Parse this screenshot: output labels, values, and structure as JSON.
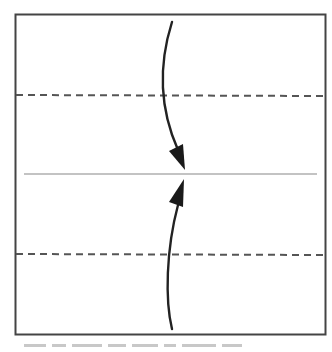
{
  "diagram": {
    "type": "fold-instruction",
    "colors": {
      "background": "#ffffff",
      "border": "#444444",
      "dashed_line": "#555555",
      "center_line": "#888888",
      "arrow": "#222222"
    },
    "square": {
      "x": 15,
      "y": 14,
      "width": 310,
      "height": 320
    },
    "fold_lines": [
      {
        "name": "upper-fold-line",
        "style": "dashed",
        "y": 95
      },
      {
        "name": "lower-fold-line",
        "style": "dashed",
        "y": 254
      }
    ],
    "center_line": {
      "style": "solid",
      "y": 174,
      "x1": 24,
      "x2": 317
    },
    "arrows": [
      {
        "name": "top-arrow",
        "direction": "down",
        "from": [
          172,
          22
        ],
        "to": [
          185,
          170
        ]
      },
      {
        "name": "bottom-arrow",
        "direction": "up",
        "from": [
          172,
          329
        ],
        "to": [
          184,
          179
        ]
      }
    ],
    "caption": ""
  }
}
